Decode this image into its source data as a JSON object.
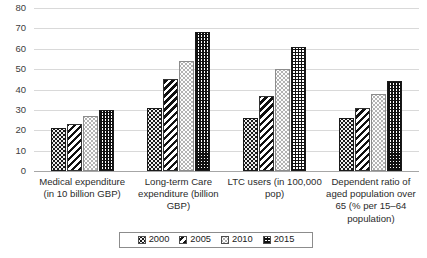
{
  "chart_data": {
    "type": "bar",
    "title": "",
    "xlabel": "",
    "ylabel": "",
    "ylim": [
      0,
      80
    ],
    "ytick_step": 10,
    "yticks": [
      "0",
      "10",
      "20",
      "30",
      "40",
      "50",
      "60",
      "70",
      "80"
    ],
    "grid": true,
    "legend_position": "bottom",
    "categories": [
      "Medical expenditure (in 10 billion GBP)",
      "Long-term Care expenditure (billion GBP)",
      "LTC users (in 100,000 pop)",
      "Dependent ratio of aged population over 65 (% per 15–64 population)"
    ],
    "category_lines": [
      [
        "Medical expenditure",
        "(in 10 billion GBP)"
      ],
      [
        "Long-term Care",
        "expenditure (billion",
        "GBP)"
      ],
      [
        "LTC users (in 100,000",
        "pop)"
      ],
      [
        "Dependent ratio of",
        "aged population over",
        "65 (% per 15–64",
        "population)"
      ]
    ],
    "series": [
      {
        "name": "2000",
        "pattern": "black-dotted",
        "values": [
          21,
          31,
          26,
          26
        ]
      },
      {
        "name": "2005",
        "pattern": "diagonal-stripes",
        "values": [
          23,
          45,
          37,
          31
        ]
      },
      {
        "name": "2010",
        "pattern": "white-dotted",
        "values": [
          27,
          54,
          50,
          38
        ]
      },
      {
        "name": "2015",
        "pattern": "crosshatch-grid",
        "values": [
          30,
          68,
          61,
          44
        ]
      }
    ]
  },
  "legend": {
    "items": [
      {
        "label": "2000"
      },
      {
        "label": "2005"
      },
      {
        "label": "2010"
      },
      {
        "label": "2015"
      }
    ]
  },
  "colors": {
    "gridline": "#d9d9d9",
    "axis": "#a6a6a6",
    "dark": "#1a1a1a",
    "light": "#ffffff",
    "text": "#2b2b2b"
  }
}
